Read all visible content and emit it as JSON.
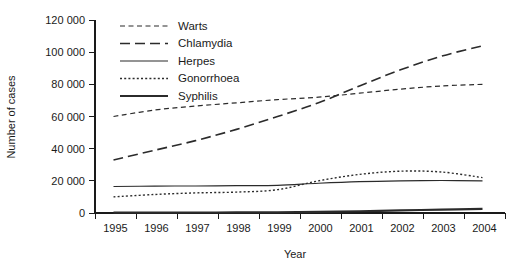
{
  "chart_data": {
    "type": "line",
    "title": "",
    "xlabel": "Year",
    "ylabel": "Number of cases",
    "x": [
      1995,
      1996,
      1997,
      1998,
      1999,
      2000,
      2001,
      2002,
      2003,
      2004
    ],
    "xtick_labels": [
      "1995",
      "1996",
      "1997",
      "1998",
      "1999",
      "2000",
      "2001",
      "2002",
      "2003",
      "2004"
    ],
    "ytick_labels": [
      "0",
      "20 000",
      "40 000",
      "60 000",
      "80 000",
      "100 000",
      "120 000"
    ],
    "ytick_values": [
      0,
      20000,
      40000,
      60000,
      80000,
      100000,
      120000
    ],
    "ylim": [
      0,
      120000
    ],
    "xlim": [
      1995,
      2004
    ],
    "grid": false,
    "legend_position": "top-left-inside",
    "series": [
      {
        "name": "Warts",
        "dash": "medium-dash",
        "width": 1.2,
        "values": [
          60000,
          64000,
          66500,
          68500,
          70500,
          72000,
          74500,
          77000,
          79000,
          80000
        ]
      },
      {
        "name": "Chlamydia",
        "dash": "long-dash",
        "width": 1.6,
        "values": [
          33000,
          39000,
          45000,
          52000,
          60000,
          68500,
          79000,
          89000,
          97500,
          104000
        ]
      },
      {
        "name": "Herpes",
        "dash": "solid",
        "width": 1.1,
        "values": [
          16500,
          16700,
          16800,
          17000,
          17200,
          18500,
          19500,
          20000,
          20200,
          20000
        ]
      },
      {
        "name": "Gonorrhoea",
        "dash": "dotted",
        "width": 1.4,
        "values": [
          10000,
          11500,
          12500,
          13000,
          14500,
          20000,
          24000,
          26000,
          25500,
          22000
        ]
      },
      {
        "name": "Syphilis",
        "dash": "solid-thick",
        "width": 2.2,
        "values": [
          200,
          250,
          300,
          350,
          450,
          700,
          1100,
          1600,
          2100,
          2600
        ]
      }
    ]
  },
  "legend": {
    "items": [
      {
        "label": "Warts"
      },
      {
        "label": "Chlamydia"
      },
      {
        "label": "Herpes"
      },
      {
        "label": "Gonorrhoea"
      },
      {
        "label": "Syphilis"
      }
    ]
  },
  "colors": {
    "ink": "#1a1a1a",
    "series": "#2b2b2b",
    "background": "#ffffff"
  }
}
